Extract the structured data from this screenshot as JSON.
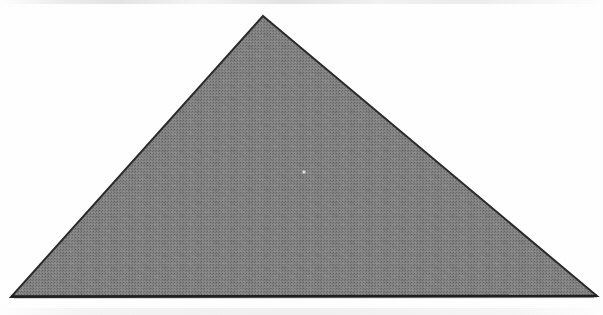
{
  "figure": {
    "medium": "scanned printed page",
    "canvas": {
      "width": 603,
      "height": 315
    },
    "background_color": "#ffffff",
    "caption": ""
  },
  "shape": {
    "name": "triangle",
    "kind": "polygon",
    "sides": 3,
    "fill_color": "#8e8e8e",
    "fill_texture": "halftone-dither",
    "stroke_color": "#2b2b2b",
    "stroke_width": 2,
    "points_attr": "263,16 597,296 11,297",
    "vertices": [
      {
        "label": "apex",
        "x": 263,
        "y": 16
      },
      {
        "label": "bottom-right",
        "x": 597,
        "y": 296
      },
      {
        "label": "bottom-left",
        "x": 11,
        "y": 297
      }
    ],
    "base_y": 296,
    "base_length_px": 586,
    "height_px": 280
  },
  "marks": {
    "speck": {
      "name": "ink-void-speck",
      "x": 304,
      "y": 172,
      "radius": 2.2,
      "color": "#d8d8d8"
    }
  },
  "artifacts": {
    "top_smudge_label": "scanner edge smudge",
    "bottom_smudge_label": "scanner edge smudge",
    "grain_label": "paper grain"
  }
}
